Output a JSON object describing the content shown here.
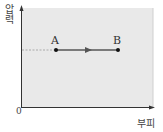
{
  "diagram": {
    "type": "pressure-volume",
    "y_axis_label": "압력",
    "x_axis_label": "부피",
    "origin_label": "0",
    "points": [
      {
        "label": "A",
        "x": 56,
        "y": 50
      },
      {
        "label": "B",
        "x": 118,
        "y": 50
      }
    ],
    "process": {
      "from": "A",
      "to": "B",
      "direction": "right",
      "kind": "constant pressure"
    },
    "colors": {
      "plot_background": "#e9e9e9",
      "axis": "#333333",
      "process_line": "#555555",
      "point": "#111111",
      "dashed_guide": "#9a9a9a"
    }
  }
}
